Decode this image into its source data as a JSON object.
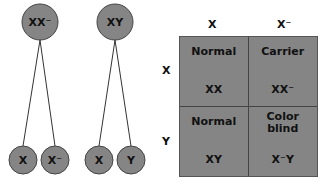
{
  "parents": [
    {
      "genotype": "XX⁻"
    },
    {
      "genotype": "XY"
    }
  ],
  "gametes": [
    {
      "parent": 0,
      "allele": "X"
    },
    {
      "parent": 0,
      "allele": "X⁻"
    },
    {
      "parent": 1,
      "allele": "X"
    },
    {
      "parent": 1,
      "allele": "Y"
    }
  ],
  "punnett": {
    "col_headers": [
      "X",
      "X⁻"
    ],
    "row_headers": [
      "X",
      "Y"
    ],
    "cells": [
      {
        "phenotype": "Normal",
        "genotype": "XX"
      },
      {
        "phenotype": "Carrier",
        "genotype": "XX⁻"
      },
      {
        "phenotype": "Normal",
        "genotype": "XY"
      },
      {
        "phenotype": "Color blind",
        "genotype": "X⁻Y"
      }
    ]
  },
  "colors": {
    "circle_fill": "#858585",
    "circle_stroke": "#444444",
    "grid_fill": "#858585",
    "text": "#111111"
  }
}
